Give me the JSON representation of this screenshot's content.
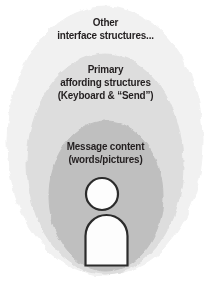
{
  "figure": {
    "type": "nested-ellipse-diagram",
    "background_color": "#ffffff",
    "text_color": "#231f20",
    "layers": [
      {
        "id": "outer",
        "name": "Other interface structures",
        "fill_color": "#f1f1f1",
        "lines": [
          "Other",
          "interface structures..."
        ]
      },
      {
        "id": "middle",
        "name": "Primary affording structures",
        "fill_color": "#dddddd",
        "lines": [
          "Primary",
          "affording structures",
          "(Keyboard & “Send”)"
        ]
      },
      {
        "id": "inner",
        "name": "Message content",
        "fill_color": "#bfbfbf",
        "lines": [
          "Message content",
          "(words/pictures)"
        ]
      }
    ],
    "person": {
      "label": "person-figure",
      "fill_color": "#fdfdfd",
      "outline_color": "#2b2b2b"
    }
  }
}
